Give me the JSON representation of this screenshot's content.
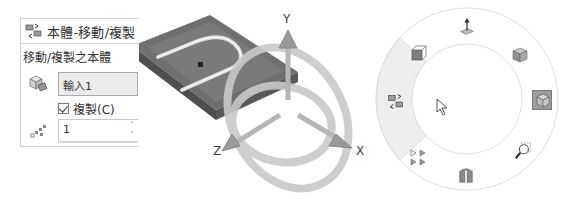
{
  "panel": {
    "title": "本體-移動/複製",
    "section_title": "移動/複製之本體",
    "bodies_field_value": "輸入1",
    "copy_checkbox": {
      "label": "複製(C)",
      "checked": true
    },
    "copies_spinner": {
      "value": "1",
      "up": "˄",
      "down": "˅"
    },
    "icons": [
      "move-copy-body-icon",
      "solid-bodies-icon",
      "pattern-copies-icon"
    ]
  },
  "triad": {
    "axes": {
      "x": "X",
      "y": "Y",
      "z": "Z"
    },
    "color": "#9a9a9a"
  },
  "radial_menu": {
    "items": [
      {
        "name": "normal-to-icon",
        "position": "top"
      },
      {
        "name": "view-orientation-cube-icon",
        "position": "upper-right"
      },
      {
        "name": "display-style-selected-icon",
        "position": "right",
        "selected": true
      },
      {
        "name": "zoom-to-area-icon",
        "position": "lower-right"
      },
      {
        "name": "section-view-icon",
        "position": "bottom"
      },
      {
        "name": "display-pane-icon",
        "position": "lower-left"
      },
      {
        "name": "move-copy-bodies-icon",
        "position": "left",
        "highlighted": true
      },
      {
        "name": "hidden-lines-box-icon",
        "position": "upper-left"
      }
    ],
    "highlight_color": "#eeeeee",
    "ring_color": "#e2e2e2"
  }
}
